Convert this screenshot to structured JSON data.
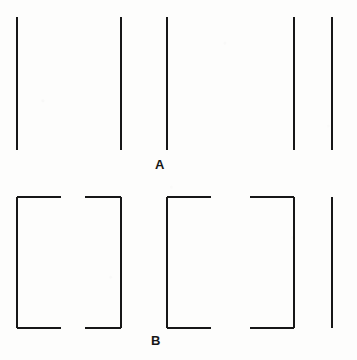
{
  "figure": {
    "background_color": "#fdfdfc",
    "stroke_color": "#171717",
    "stroke_width": 1.6,
    "width": 357,
    "height": 360
  },
  "panels": [
    {
      "id": "A",
      "label": "A",
      "label_x": 155,
      "label_y": 158,
      "description": "Five equally salient bare vertical lines in irregular spacing",
      "line_top": 17,
      "line_bottom": 150,
      "verticals": [
        {
          "name": "vertical-line-1",
          "x": 17
        },
        {
          "name": "vertical-line-2",
          "x": 121
        },
        {
          "name": "vertical-line-3",
          "x": 167
        },
        {
          "name": "vertical-line-4",
          "x": 294
        },
        {
          "name": "vertical-line-5",
          "x": 332
        }
      ],
      "brackets": []
    },
    {
      "id": "B",
      "label": "B",
      "label_x": 151,
      "label_y": 334,
      "description": "Same five verticals with horizontal end-caps added so pairs close into bracket regions",
      "line_top": 197,
      "line_bottom": 328,
      "verticals": [
        {
          "name": "vertical-line-1",
          "x": 17
        },
        {
          "name": "vertical-line-2",
          "x": 121
        },
        {
          "name": "vertical-line-3",
          "x": 167
        },
        {
          "name": "vertical-line-4",
          "x": 294
        },
        {
          "name": "vertical-line-5",
          "x": 332
        }
      ],
      "brackets": [
        {
          "name": "bracket-left-open-right",
          "x": 17,
          "cap_to": 61,
          "direction": "right"
        },
        {
          "name": "bracket-right-open-left",
          "x": 121,
          "cap_to": 85,
          "direction": "left"
        },
        {
          "name": "bracket-left-open-right",
          "x": 167,
          "cap_to": 211,
          "direction": "right"
        },
        {
          "name": "bracket-right-open-left",
          "x": 294,
          "cap_to": 250,
          "direction": "left"
        }
      ]
    }
  ]
}
